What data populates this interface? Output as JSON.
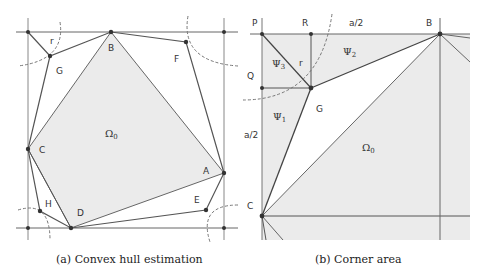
{
  "figure": {
    "panels": [
      {
        "id": "a",
        "caption": "(a) Convex hull estimation",
        "region_label": "Ω",
        "region_subscript": "0",
        "points": {
          "A": "A",
          "B": "B",
          "C": "C",
          "D": "D",
          "E": "E",
          "F": "F",
          "G": "G",
          "H": "H"
        },
        "radius_label": "r"
      },
      {
        "id": "b",
        "caption": "(b) Corner area",
        "region_label": "Ω",
        "region_subscript": "0",
        "points": {
          "P": "P",
          "R": "R",
          "B": "B",
          "Q": "Q",
          "G": "G",
          "C": "C"
        },
        "segment_labels": {
          "top": "a/2",
          "left": "a/2",
          "radius": "r"
        },
        "subregions": {
          "psi1": "Ψ",
          "psi1_sub": "1",
          "psi2": "Ψ",
          "psi2_sub": "2",
          "psi3": "Ψ",
          "psi3_sub": "3"
        }
      }
    ],
    "colors": {
      "fill": "#ebebeb",
      "line": "#555555",
      "point": "#333333",
      "dashed": "#777777"
    }
  }
}
